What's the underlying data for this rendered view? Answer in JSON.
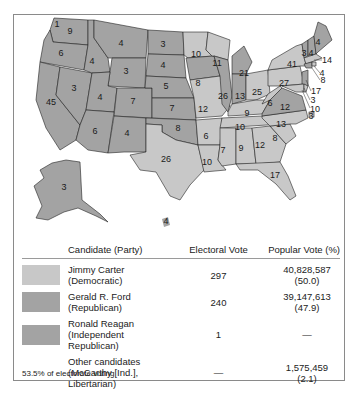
{
  "colors": {
    "carter": "#c8c8c8",
    "ford": "#a3a3a3",
    "reagan": "#a3a3a3",
    "border": "#222222"
  },
  "map": {
    "states": [
      {
        "id": "WA",
        "ev": "9",
        "winner": "ford"
      },
      {
        "id": "WA-1",
        "ev": "1",
        "winner": "reagan"
      },
      {
        "id": "OR",
        "ev": "6",
        "winner": "ford"
      },
      {
        "id": "CA",
        "ev": "45",
        "winner": "ford"
      },
      {
        "id": "NV",
        "ev": "3",
        "winner": "ford"
      },
      {
        "id": "ID",
        "ev": "4",
        "winner": "ford"
      },
      {
        "id": "MT",
        "ev": "4",
        "winner": "ford"
      },
      {
        "id": "WY",
        "ev": "3",
        "winner": "ford"
      },
      {
        "id": "UT",
        "ev": "4",
        "winner": "ford"
      },
      {
        "id": "CO",
        "ev": "7",
        "winner": "ford"
      },
      {
        "id": "AZ",
        "ev": "6",
        "winner": "ford"
      },
      {
        "id": "NM",
        "ev": "4",
        "winner": "ford"
      },
      {
        "id": "ND",
        "ev": "3",
        "winner": "ford"
      },
      {
        "id": "SD",
        "ev": "4",
        "winner": "ford"
      },
      {
        "id": "NE",
        "ev": "5",
        "winner": "ford"
      },
      {
        "id": "KS",
        "ev": "7",
        "winner": "ford"
      },
      {
        "id": "OK",
        "ev": "8",
        "winner": "ford"
      },
      {
        "id": "TX",
        "ev": "26",
        "winner": "carter"
      },
      {
        "id": "MN",
        "ev": "10",
        "winner": "carter"
      },
      {
        "id": "IA",
        "ev": "8",
        "winner": "ford"
      },
      {
        "id": "MO",
        "ev": "12",
        "winner": "carter"
      },
      {
        "id": "AR",
        "ev": "6",
        "winner": "carter"
      },
      {
        "id": "LA",
        "ev": "10",
        "winner": "carter"
      },
      {
        "id": "WI",
        "ev": "11",
        "winner": "carter"
      },
      {
        "id": "IL",
        "ev": "26",
        "winner": "ford"
      },
      {
        "id": "MI",
        "ev": "21",
        "winner": "ford"
      },
      {
        "id": "IN",
        "ev": "13",
        "winner": "ford"
      },
      {
        "id": "OH",
        "ev": "25",
        "winner": "carter"
      },
      {
        "id": "KY",
        "ev": "9",
        "winner": "carter"
      },
      {
        "id": "TN",
        "ev": "10",
        "winner": "carter"
      },
      {
        "id": "MS",
        "ev": "7",
        "winner": "carter"
      },
      {
        "id": "AL",
        "ev": "9",
        "winner": "carter"
      },
      {
        "id": "GA",
        "ev": "12",
        "winner": "carter"
      },
      {
        "id": "FL",
        "ev": "17",
        "winner": "carter"
      },
      {
        "id": "SC",
        "ev": "8",
        "winner": "carter"
      },
      {
        "id": "NC",
        "ev": "13",
        "winner": "carter"
      },
      {
        "id": "VA",
        "ev": "12",
        "winner": "ford"
      },
      {
        "id": "WV",
        "ev": "6",
        "winner": "carter"
      },
      {
        "id": "PA",
        "ev": "27",
        "winner": "carter"
      },
      {
        "id": "NY",
        "ev": "41",
        "winner": "carter"
      },
      {
        "id": "VT",
        "ev": "3",
        "winner": "ford"
      },
      {
        "id": "NH",
        "ev": "4",
        "winner": "ford"
      },
      {
        "id": "ME",
        "ev": "4",
        "winner": "ford"
      },
      {
        "id": "MA",
        "ev": "14",
        "winner": "carter"
      },
      {
        "id": "RI",
        "ev": "4",
        "winner": "carter"
      },
      {
        "id": "CT",
        "ev": "8",
        "winner": "ford"
      },
      {
        "id": "NJ",
        "ev": "17",
        "winner": "ford"
      },
      {
        "id": "DE",
        "ev": "3",
        "winner": "carter"
      },
      {
        "id": "MD",
        "ev": "10",
        "winner": "carter"
      },
      {
        "id": "DC",
        "ev": "3",
        "winner": "carter"
      },
      {
        "id": "AK",
        "ev": "3",
        "winner": "ford"
      },
      {
        "id": "HI",
        "ev": "4",
        "winner": "carter"
      }
    ]
  },
  "table": {
    "headers": {
      "candidate": "Candidate (Party)",
      "electoral": "Electoral Vote",
      "popular": "Popular Vote (%)"
    },
    "rows": [
      {
        "name": "Jimmy Carter",
        "party": "(Democratic)",
        "electoral": "297",
        "popular": "40,828,587",
        "pct": "(50.0)",
        "swatch": "carter"
      },
      {
        "name": "Gerald R. Ford",
        "party": "(Republican)",
        "electoral": "240",
        "popular": "39,147,613",
        "pct": "(47.9)",
        "swatch": "ford"
      },
      {
        "name": "Ronald Reagan",
        "party": "(Independent Republican)",
        "electoral": "1",
        "popular": "—",
        "pct": "",
        "swatch": "reagan"
      },
      {
        "name": "Other candidates",
        "party": "(McCarthy [Ind.],",
        "party2": "Libertarian)",
        "electoral": "—",
        "popular": "1,575,459",
        "pct": "(2.1)",
        "swatch": null
      }
    ]
  },
  "footnote": "53.5% of electorate voting"
}
